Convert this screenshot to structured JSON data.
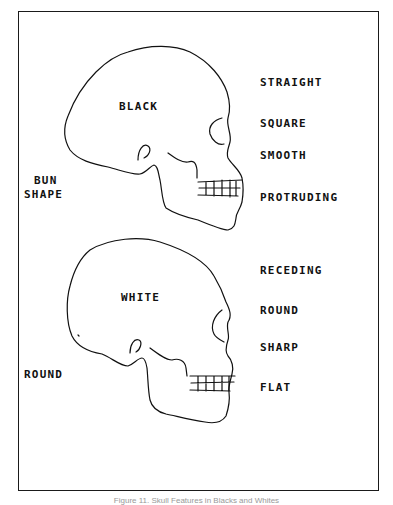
{
  "figure": {
    "caption": "Figure 11. Skull Features in Blacks and Whites"
  },
  "black_skull": {
    "label": "BLACK",
    "back_of_head_label": [
      "BUN",
      "SHAPE"
    ],
    "feature_labels": [
      "STRAIGHT",
      "SQUARE",
      "SMOOTH",
      "PROTRUDING"
    ]
  },
  "white_skull": {
    "label": "WHITE",
    "back_of_head_label": "ROUND",
    "feature_labels": [
      "RECEDING",
      "ROUND",
      "SHARP",
      "FLAT"
    ]
  },
  "colors": {
    "line": "#111111",
    "background": "#ffffff",
    "caption": "#999999"
  }
}
